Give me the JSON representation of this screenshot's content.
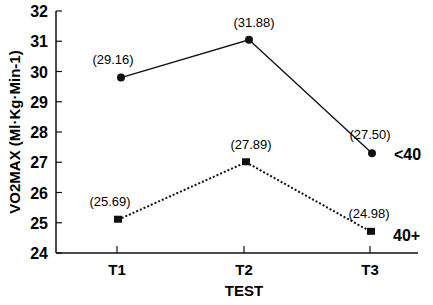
{
  "chart_data": {
    "type": "line",
    "title": "",
    "xlabel": "TEST",
    "ylabel": "VO2MAX (Ml·Kg·Min-1)",
    "categories": [
      "T1",
      "T2",
      "T3"
    ],
    "ylim": [
      24,
      32
    ],
    "yticks": [
      "24",
      "25",
      "26",
      "27",
      "28",
      "29",
      "30",
      "31",
      "32"
    ],
    "grid": false,
    "series": [
      {
        "name": "<40",
        "values": [
          29.16,
          31.88,
          27.5
        ],
        "labels": [
          "(29.16)",
          "(31.88)",
          "(27.50)"
        ],
        "plot_y": [
          29.8,
          31.05,
          27.3
        ],
        "marker": "circle",
        "line": "solid"
      },
      {
        "name": "40+",
        "values": [
          25.69,
          27.89,
          24.98
        ],
        "labels": [
          "(25.69)",
          "(27.89)",
          "(24.98)"
        ],
        "plot_y": [
          25.1,
          27.0,
          24.7
        ],
        "marker": "square",
        "line": "dotted"
      }
    ]
  }
}
